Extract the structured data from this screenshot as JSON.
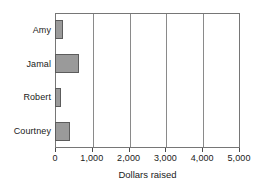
{
  "chart_data": {
    "type": "bar",
    "orientation": "horizontal",
    "title": "",
    "xlabel": "Dollars raised",
    "ylabel": "",
    "categories": [
      "Amy",
      "Jamal",
      "Robert",
      "Courtney"
    ],
    "values": [
      220,
      650,
      150,
      400
    ],
    "xlim": [
      0,
      5000
    ],
    "xticks": [
      0,
      1000,
      2000,
      3000,
      4000,
      5000
    ],
    "xticklabels": [
      "0",
      "1,000",
      "2,000",
      "3,000",
      "4,000",
      "5,000"
    ],
    "grid": "vertical",
    "legend": null,
    "bar_color": "#9a9a9a",
    "bar_edge_color": "#5c5c5c",
    "frame_color": "#767676",
    "gridline_color": "#8a8a8a",
    "background": "#ffffff"
  }
}
